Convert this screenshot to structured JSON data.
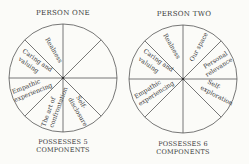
{
  "person_one": {
    "title": "PERSON ONE",
    "footer_line1": "POSSESSES 5",
    "footer_line2": "COMPONENTS",
    "segments": [
      {
        "label": "Realness"
      },
      {
        "label_line1": "Caring and",
        "label_line2": "valuing"
      },
      {
        "label_line1": "Empathic",
        "label_line2": "experiencing"
      },
      {
        "label_line1": "The art of",
        "label_line2": "confrontation"
      },
      {
        "label_line1": "Self-",
        "label_line2": "disclosure"
      }
    ]
  },
  "person_two": {
    "title": "PERSON TWO",
    "footer_line1": "POSSESSES 6",
    "footer_line2": "COMPONENTS",
    "segments": [
      {
        "label": "Realness"
      },
      {
        "label_line1": "Caring and",
        "label_line2": "valuing"
      },
      {
        "label_line1": "Empathic",
        "label_line2": "experiencing"
      },
      {
        "label": "Our space"
      },
      {
        "label_line1": "Personal",
        "label_line2": "relevance"
      },
      {
        "label_line1": "Self-",
        "label_line2": "exploration"
      }
    ]
  },
  "colors": {
    "line": "#555555",
    "text": "#3a3a3a",
    "background": "#fbfbf8"
  }
}
